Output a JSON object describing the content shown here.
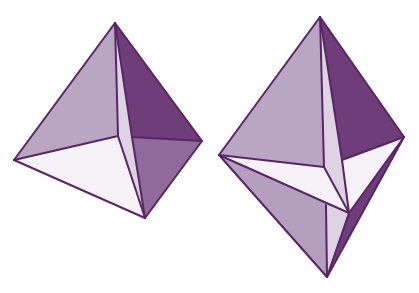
{
  "figure": {
    "colors": {
      "background": "#ffffff",
      "outline": "#5a2566",
      "face_light": "#b9a6c2",
      "face_dark": "#6e3d7a",
      "face_mid": "#8f6a9a",
      "face_white": "#f6f2f7",
      "face_sliver": "#ddd3e2",
      "face_lower_light": "#b4a0be"
    },
    "shapes": [
      {
        "name": "tetrahedron",
        "faces": [
          {
            "name": "left-face",
            "points": "115,23 14,160 118,136",
            "fill": "face_light"
          },
          {
            "name": "right-upper-face",
            "points": "115,23 132,137 202,141",
            "fill": "face_dark"
          },
          {
            "name": "right-lower-face",
            "points": "132,137 202,141 145,218",
            "fill": "face_mid"
          },
          {
            "name": "sliver-face",
            "points": "115,23 118,136 145,218 132,137",
            "fill": "face_sliver"
          },
          {
            "name": "bottom-face",
            "points": "14,160 118,136 145,218",
            "fill": "face_white"
          }
        ],
        "edges": [
          "115,23 14,160",
          "115,23 202,141",
          "14,160 145,218",
          "202,141 145,218",
          "115,23 118,136",
          "115,23 132,137",
          "14,160 118,136",
          "118,136 145,218",
          "132,137 145,218",
          "132,137 202,141"
        ]
      },
      {
        "name": "bipyramid",
        "faces": [
          {
            "name": "upper-left-face",
            "points": "320,17 219,155 324,167",
            "fill": "face_light"
          },
          {
            "name": "upper-right-face",
            "points": "320,17 342,160 404,137",
            "fill": "face_dark"
          },
          {
            "name": "upper-sliver-face",
            "points": "320,17 324,167 349,213 342,160",
            "fill": "face_sliver"
          },
          {
            "name": "middle-left-white-face",
            "points": "219,155 324,167 349,213",
            "fill": "face_white"
          },
          {
            "name": "middle-right-white-face",
            "points": "342,160 404,137 349,213",
            "fill": "face_white"
          },
          {
            "name": "lower-left-face",
            "points": "219,155 349,213 326,205 327,277",
            "fill": "face_lower_light"
          },
          {
            "name": "lower-sliver-face",
            "points": "326,205 349,213 327,277",
            "fill": "face_sliver"
          },
          {
            "name": "lower-right-strip",
            "points": "404,137 349,213 327,277",
            "fill": "face_dark"
          }
        ],
        "edges": [
          "320,17 219,155",
          "320,17 404,137",
          "219,155 327,277",
          "404,137 327,277",
          "320,17 324,167",
          "320,17 342,160",
          "219,155 324,167",
          "324,167 349,213",
          "342,160 349,213",
          "342,160 404,137",
          "219,155 349,213",
          "404,137 349,213",
          "349,213 327,277",
          "326,205 327,277"
        ]
      }
    ]
  }
}
